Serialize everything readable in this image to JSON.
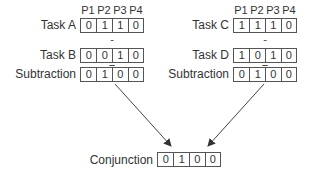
{
  "headers": [
    "P1",
    "P2",
    "P3",
    "P4"
  ],
  "left": {
    "task1": {
      "label": "Task A",
      "values": [
        "0",
        "1",
        "1",
        "0"
      ]
    },
    "operator": "-",
    "task2": {
      "label": "Task B",
      "values": [
        "0",
        "0",
        "1",
        "0"
      ]
    },
    "equals": "=",
    "result": {
      "label": "Subtraction",
      "values": [
        "0",
        "1",
        "0",
        "0"
      ]
    }
  },
  "right": {
    "task1": {
      "label": "Task C",
      "values": [
        "1",
        "1",
        "1",
        "0"
      ]
    },
    "operator": "-",
    "task2": {
      "label": "Task D",
      "values": [
        "1",
        "0",
        "1",
        "0"
      ]
    },
    "equals": "=",
    "result": {
      "label": "Subtraction",
      "values": [
        "0",
        "1",
        "0",
        "0"
      ]
    }
  },
  "conjunction": {
    "label": "Conjunction",
    "values": [
      "0",
      "1",
      "0",
      "0"
    ]
  },
  "colors": {
    "stroke": "#555555",
    "text": "#333333"
  }
}
